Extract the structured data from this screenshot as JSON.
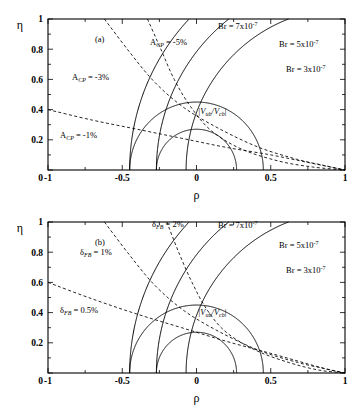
{
  "figure": {
    "background": "#ffffff",
    "line_color": "#000000",
    "panels": [
      {
        "id": "a",
        "tag": "(a)",
        "xlabel": "ρ",
        "ylabel": "η",
        "xticks": [
          "-1",
          "-0.5",
          "0",
          "0.5",
          "1"
        ],
        "xtick_values": [
          -1,
          -0.5,
          0,
          0.5,
          1
        ],
        "yticks": [
          "0",
          "0.2",
          "0.4",
          "0.6",
          "0.8",
          "1"
        ],
        "ytick_values": [
          0,
          0.2,
          0.4,
          0.6,
          0.8,
          1
        ],
        "xlim": [
          -1,
          1
        ],
        "ylim": [
          0,
          1
        ],
        "origin_zero_label": "0",
        "annotations": [
          {
            "name": "br7-label",
            "text": "Br = 7x10",
            "sup": "-7",
            "x": 218,
            "y": 29
          },
          {
            "name": "br5-label",
            "text": "Br = 5x10",
            "sup": "-7",
            "x": 279,
            "y": 47
          },
          {
            "name": "br3-label",
            "text": "Br = 3x10",
            "sup": "-7",
            "x": 286,
            "y": 72
          },
          {
            "name": "acp5-label",
            "text": "A",
            "sub": "CP",
            "tail": " = -5%",
            "x": 150,
            "y": 45
          },
          {
            "name": "acp3-label",
            "text": "A",
            "sub": "CP",
            "tail": " = -3%",
            "x": 72,
            "y": 80
          },
          {
            "name": "acp1-label",
            "text": "A",
            "sub": "CP",
            "tail": " = -1%",
            "x": 60,
            "y": 138
          },
          {
            "name": "vub-vcb-label",
            "text": "|V",
            "sub": "ub",
            "mid": "/V",
            "sub2": "cb",
            "tail": "|",
            "x": 198,
            "y": 114
          }
        ]
      },
      {
        "id": "b",
        "tag": "(b)",
        "xlabel": "ρ",
        "ylabel": "η",
        "xticks": [
          "-1",
          "-0.5",
          "0",
          "0.5",
          "1"
        ],
        "xtick_values": [
          -1,
          -0.5,
          0,
          0.5,
          1
        ],
        "yticks": [
          "0",
          "0.2",
          "0.4",
          "0.6",
          "0.8",
          "1"
        ],
        "ytick_values": [
          0,
          0.2,
          0.4,
          0.6,
          0.8,
          1
        ],
        "xlim": [
          -1,
          1
        ],
        "ylim": [
          0,
          1
        ],
        "origin_zero_label": "0",
        "annotations": [
          {
            "name": "br7-label",
            "text": "Br = 7x10",
            "sup": "-7",
            "x": 218,
            "y": 25
          },
          {
            "name": "br5-label",
            "text": "Br = 5x10",
            "sup": "-7",
            "x": 279,
            "y": 45
          },
          {
            "name": "br3-label",
            "text": "Br = 3x10",
            "sup": "-7",
            "x": 286,
            "y": 70
          },
          {
            "name": "dfb2-label",
            "text": "δ",
            "sub": "FB",
            "tail": " = 2%",
            "x": 152,
            "y": 24
          },
          {
            "name": "dfb1-label",
            "text": "δ",
            "sub": "FB",
            "tail": " = 1%",
            "x": 80,
            "y": 52
          },
          {
            "name": "dfb05-label",
            "text": "δ",
            "sub": "FB",
            "tail": " = 0.5%",
            "x": 60,
            "y": 110
          },
          {
            "name": "vub-vcb-label",
            "text": "|V",
            "sub": "ub",
            "mid": "/V",
            "sub2": "cb",
            "tail": "|",
            "x": 198,
            "y": 112
          }
        ]
      }
    ]
  },
  "chart_data": {
    "type": "line",
    "title": "",
    "xlabel": "ρ",
    "ylabel": "η",
    "xlim": [
      -1,
      1
    ],
    "ylim": [
      0,
      1
    ],
    "grid": false,
    "legend": "inline annotations",
    "panels": [
      {
        "panel": "a",
        "tag": "(a)",
        "series": [
          {
            "name": "Br = 7x10^-7",
            "style": "solid",
            "type": "circle-arc",
            "center": [
              1,
              0
            ],
            "radius": 1.07,
            "x_intercept": -0.07,
            "description": "solid circular contour of constant branching ratio centred at the apex (1,0)"
          },
          {
            "name": "Br = 5x10^-7",
            "style": "solid",
            "type": "circle-arc",
            "center": [
              1,
              0
            ],
            "radius": 1.27,
            "x_intercept": -0.27,
            "description": "solid circular contour of constant branching ratio centred at the apex (1,0)"
          },
          {
            "name": "Br = 3x10^-7",
            "style": "solid",
            "type": "circle-arc",
            "center": [
              1,
              0
            ],
            "radius": 1.45,
            "x_intercept": -0.45,
            "description": "solid circular contour of constant branching ratio centred at the apex (1,0)"
          },
          {
            "name": "|Vub/Vcb| upper",
            "style": "solid",
            "type": "circle-arc",
            "center": [
              0,
              0
            ],
            "radius": 0.45,
            "description": "semicircle centred at origin giving upper bound of |Vub/Vcb|"
          },
          {
            "name": "|Vub/Vcb| lower",
            "style": "solid",
            "type": "circle-arc",
            "center": [
              0,
              0
            ],
            "radius": 0.27,
            "description": "semicircle centred at origin giving lower bound of |Vub/Vcb|"
          },
          {
            "name": "A_CP = -5%",
            "style": "dashed",
            "type": "contour",
            "points": [
              [
                -0.33,
                1.0
              ],
              [
                -0.24,
                0.8
              ],
              [
                -0.15,
                0.6
              ],
              [
                -0.04,
                0.42
              ],
              [
                0.1,
                0.26
              ],
              [
                0.3,
                0.14
              ],
              [
                0.55,
                0.06
              ],
              [
                0.78,
                0.02
              ],
              [
                1.0,
                0.0
              ]
            ],
            "description": "dashed CP-asymmetry contour"
          },
          {
            "name": "A_CP = -3%",
            "style": "dashed",
            "type": "contour",
            "points": [
              [
                -0.62,
                1.0
              ],
              [
                -0.45,
                0.78
              ],
              [
                -0.28,
                0.58
              ],
              [
                -0.08,
                0.41
              ],
              [
                0.16,
                0.27
              ],
              [
                0.42,
                0.15
              ],
              [
                0.68,
                0.07
              ],
              [
                0.86,
                0.03
              ],
              [
                1.0,
                0.0
              ]
            ],
            "description": "dashed CP-asymmetry contour"
          },
          {
            "name": "A_CP = -1%",
            "style": "dashed",
            "type": "contour",
            "points": [
              [
                -1.0,
                0.4
              ],
              [
                -0.7,
                0.33
              ],
              [
                -0.4,
                0.27
              ],
              [
                -0.1,
                0.21
              ],
              [
                0.2,
                0.15
              ],
              [
                0.5,
                0.1
              ],
              [
                0.75,
                0.05
              ],
              [
                0.9,
                0.02
              ],
              [
                1.0,
                0.0
              ]
            ],
            "description": "dashed CP-asymmetry contour"
          }
        ]
      },
      {
        "panel": "b",
        "tag": "(b)",
        "series": [
          {
            "name": "Br = 7x10^-7",
            "style": "solid",
            "type": "circle-arc",
            "center": [
              1,
              0
            ],
            "radius": 1.07,
            "x_intercept": -0.07,
            "description": "solid circular contour of constant branching ratio centred at the apex (1,0)"
          },
          {
            "name": "Br = 5x10^-7",
            "style": "solid",
            "type": "circle-arc",
            "center": [
              1,
              0
            ],
            "radius": 1.27,
            "x_intercept": -0.27,
            "description": "solid circular contour of constant branching ratio centred at the apex (1,0)"
          },
          {
            "name": "Br = 3x10^-7",
            "style": "solid",
            "type": "circle-arc",
            "center": [
              1,
              0
            ],
            "radius": 1.45,
            "x_intercept": -0.45,
            "description": "solid circular contour of constant branching ratio centred at the apex (1,0)"
          },
          {
            "name": "|Vub/Vcb| upper",
            "style": "solid",
            "type": "circle-arc",
            "center": [
              0,
              0
            ],
            "radius": 0.45,
            "description": "semicircle centred at origin giving upper bound of |Vub/Vcb|"
          },
          {
            "name": "|Vub/Vcb| lower",
            "style": "solid",
            "type": "circle-arc",
            "center": [
              0,
              0
            ],
            "radius": 0.27,
            "description": "semicircle centred at origin giving lower bound of |Vub/Vcb|"
          },
          {
            "name": "delta_FB = 2%",
            "style": "dashed",
            "type": "contour",
            "points": [
              [
                -0.2,
                1.0
              ],
              [
                -0.12,
                0.8
              ],
              [
                -0.03,
                0.6
              ],
              [
                0.07,
                0.42
              ],
              [
                0.2,
                0.27
              ],
              [
                0.4,
                0.15
              ],
              [
                0.62,
                0.07
              ],
              [
                0.82,
                0.02
              ],
              [
                1.0,
                0.0
              ]
            ],
            "description": "dashed forward-backward asymmetry contour"
          },
          {
            "name": "delta_FB = 1%",
            "style": "dashed",
            "type": "contour",
            "points": [
              [
                -0.62,
                1.0
              ],
              [
                -0.45,
                0.78
              ],
              [
                -0.28,
                0.58
              ],
              [
                -0.08,
                0.41
              ],
              [
                0.16,
                0.27
              ],
              [
                0.42,
                0.15
              ],
              [
                0.68,
                0.07
              ],
              [
                0.86,
                0.03
              ],
              [
                1.0,
                0.0
              ]
            ],
            "description": "dashed forward-backward asymmetry contour"
          },
          {
            "name": "delta_FB = 0.5%",
            "style": "dashed",
            "type": "contour",
            "points": [
              [
                -1.0,
                0.6
              ],
              [
                -0.7,
                0.49
              ],
              [
                -0.4,
                0.39
              ],
              [
                -0.1,
                0.3
              ],
              [
                0.2,
                0.21
              ],
              [
                0.5,
                0.13
              ],
              [
                0.75,
                0.06
              ],
              [
                0.9,
                0.02
              ],
              [
                1.0,
                0.0
              ]
            ],
            "description": "dashed forward-backward asymmetry contour"
          }
        ]
      }
    ]
  }
}
